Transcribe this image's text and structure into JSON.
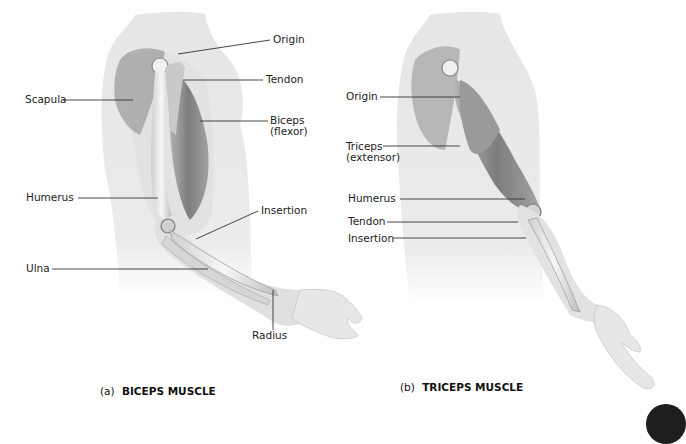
{
  "figure": {
    "panels": [
      {
        "id": "a",
        "caption_prefix": "(a)",
        "caption_title": "BICEPS MUSCLE",
        "labels": {
          "origin": "Origin",
          "tendon": "Tendon",
          "scapula": "Scapula",
          "biceps_line1": "Biceps",
          "biceps_line2": "(flexor)",
          "humerus": "Humerus",
          "insertion": "Insertion",
          "ulna": "Ulna",
          "radius": "Radius"
        }
      },
      {
        "id": "b",
        "caption_prefix": "(b)",
        "caption_title": "TRICEPS MUSCLE",
        "labels": {
          "origin": "Origin",
          "triceps_line1": "Triceps",
          "triceps_line2": "(extensor)",
          "humerus": "Humerus",
          "tendon": "Tendon",
          "insertion": "Insertion"
        }
      }
    ]
  },
  "colors": {
    "background": "#ffffff",
    "skin": "#e6e6e6",
    "muscle": "#8a8a8a",
    "bone": "#f2f2f2",
    "leader_line": "#333333",
    "corner_badge": "#1e1e1e"
  }
}
